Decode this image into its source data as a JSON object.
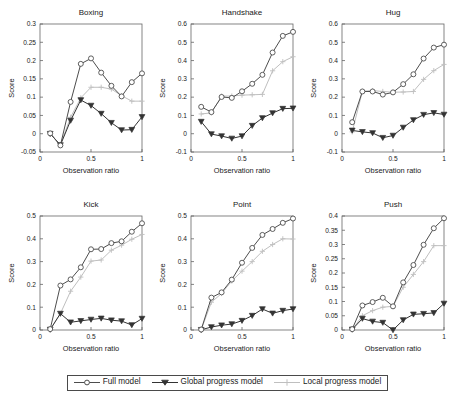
{
  "figure": {
    "axis_label_x": "Observation ratio",
    "axis_label_y": "Score",
    "xticks": [
      "0",
      "0.5",
      "1"
    ],
    "xtick_values": [
      0,
      0.5,
      1
    ]
  },
  "legend": {
    "position": "bottom-center",
    "entries": [
      {
        "label": "Full model",
        "marker": "circle",
        "color": "#4d4d4d"
      },
      {
        "label": "Global progress model",
        "marker": "triangle-down",
        "color": "#333333"
      },
      {
        "label": "Local progress model",
        "marker": "plus",
        "color": "#bfbfbf"
      }
    ]
  },
  "chart_data": [
    {
      "type": "line",
      "title": "Boxing",
      "xlabel": "Observation ratio",
      "ylabel": "Score",
      "xlim": [
        0,
        1
      ],
      "ylim": [
        -0.05,
        0.3
      ],
      "yticks": [
        -0.05,
        0,
        0.05,
        0.1,
        0.15,
        0.2,
        0.25,
        0.3
      ],
      "ytick_labels": [
        "-0.05",
        "0",
        "0.05",
        "0.1",
        "0.15",
        "0.2",
        "0.25",
        "0.3"
      ],
      "grid": false,
      "x": [
        0.1,
        0.2,
        0.3,
        0.4,
        0.5,
        0.6,
        0.7,
        0.8,
        0.9,
        1.0
      ],
      "series": [
        {
          "name": "Full model",
          "marker": "circle",
          "color": "#4d4d4d",
          "values": [
            0.001,
            -0.032,
            0.087,
            0.191,
            0.206,
            0.167,
            0.131,
            0.102,
            0.141,
            0.165
          ]
        },
        {
          "name": "Global progress model",
          "marker": "triangle-down",
          "color": "#333333",
          "values": [
            0.0,
            -0.031,
            0.036,
            0.092,
            0.077,
            0.055,
            0.03,
            0.01,
            0.011,
            0.046,
            0.074
          ]
        },
        {
          "name": "Local progress model",
          "marker": "plus",
          "color": "#bfbfbf",
          "values": [
            0.0,
            -0.03,
            0.045,
            0.098,
            0.127,
            0.127,
            0.122,
            0.104,
            0.089,
            0.089
          ]
        }
      ]
    },
    {
      "type": "line",
      "title": "Handshake",
      "xlabel": "Observation ratio",
      "ylabel": "Score",
      "xlim": [
        0,
        1
      ],
      "ylim": [
        -0.1,
        0.6
      ],
      "yticks": [
        -0.1,
        0,
        0.1,
        0.2,
        0.3,
        0.4,
        0.5,
        0.6
      ],
      "ytick_labels": [
        "-0.1",
        "0",
        "0.1",
        "0.2",
        "0.3",
        "0.4",
        "0.5",
        "0.6"
      ],
      "grid": false,
      "x": [
        0.1,
        0.2,
        0.3,
        0.4,
        0.5,
        0.6,
        0.7,
        0.8,
        0.9,
        1.0
      ],
      "series": [
        {
          "name": "Full model",
          "marker": "circle",
          "color": "#4d4d4d",
          "values": [
            0.147,
            0.118,
            0.201,
            0.196,
            0.232,
            0.273,
            0.322,
            0.444,
            0.535,
            0.557
          ]
        },
        {
          "name": "Global progress model",
          "marker": "triangle-down",
          "color": "#333333",
          "values": [
            0.066,
            -0.002,
            -0.013,
            -0.026,
            -0.013,
            0.044,
            0.086,
            0.113,
            0.137,
            0.139
          ]
        },
        {
          "name": "Local progress model",
          "marker": "plus",
          "color": "#bfbfbf",
          "values": [
            0.108,
            0.114,
            0.206,
            0.206,
            0.211,
            0.213,
            0.215,
            0.344,
            0.394,
            0.421
          ]
        }
      ]
    },
    {
      "type": "line",
      "title": "Hug",
      "xlabel": "Observation ratio",
      "ylabel": "Score",
      "xlim": [
        0,
        1
      ],
      "ylim": [
        -0.1,
        0.6
      ],
      "yticks": [
        -0.1,
        0,
        0.1,
        0.2,
        0.3,
        0.4,
        0.5,
        0.6
      ],
      "ytick_labels": [
        "-0.1",
        "0",
        "0.1",
        "0.2",
        "0.3",
        "0.4",
        "0.5",
        "0.6"
      ],
      "grid": false,
      "x": [
        0.1,
        0.2,
        0.3,
        0.4,
        0.5,
        0.6,
        0.7,
        0.8,
        0.9,
        1.0
      ],
      "series": [
        {
          "name": "Full model",
          "marker": "circle",
          "color": "#4d4d4d",
          "values": [
            0.063,
            0.231,
            0.231,
            0.214,
            0.226,
            0.271,
            0.325,
            0.411,
            0.471,
            0.487
          ]
        },
        {
          "name": "Global progress model",
          "marker": "triangle-down",
          "color": "#333333",
          "values": [
            0.018,
            0.01,
            0.004,
            -0.022,
            -0.01,
            0.034,
            0.075,
            0.104,
            0.114,
            0.105
          ]
        },
        {
          "name": "Local progress model",
          "marker": "plus",
          "color": "#bfbfbf",
          "values": [
            0.01,
            0.232,
            0.236,
            0.231,
            0.227,
            0.228,
            0.231,
            0.297,
            0.345,
            0.379
          ]
        }
      ]
    },
    {
      "type": "line",
      "title": "Kick",
      "xlabel": "Observation ratio",
      "ylabel": "Score",
      "xlim": [
        0,
        1
      ],
      "ylim": [
        0,
        0.5
      ],
      "yticks": [
        0,
        0.1,
        0.2,
        0.3,
        0.4,
        0.5
      ],
      "ytick_labels": [
        "0",
        "0.1",
        "0.2",
        "0.3",
        "0.4",
        "0.5"
      ],
      "grid": false,
      "x": [
        0.1,
        0.2,
        0.3,
        0.4,
        0.5,
        0.6,
        0.7,
        0.8,
        0.9,
        1.0
      ],
      "series": [
        {
          "name": "Full model",
          "marker": "circle",
          "color": "#4d4d4d",
          "values": [
            0.004,
            0.195,
            0.222,
            0.275,
            0.354,
            0.355,
            0.381,
            0.389,
            0.431,
            0.468
          ]
        },
        {
          "name": "Global progress model",
          "marker": "triangle-down",
          "color": "#333333",
          "values": [
            0.002,
            0.072,
            0.034,
            0.04,
            0.046,
            0.051,
            0.043,
            0.039,
            0.022,
            0.05
          ]
        },
        {
          "name": "Local progress model",
          "marker": "plus",
          "color": "#bfbfbf",
          "values": [
            0.002,
            0.072,
            0.17,
            0.232,
            0.302,
            0.307,
            0.35,
            0.372,
            0.398,
            0.419
          ]
        }
      ]
    },
    {
      "type": "line",
      "title": "Point",
      "xlabel": "Observation ratio",
      "ylabel": "Score",
      "xlim": [
        0,
        1
      ],
      "ylim": [
        0,
        0.5
      ],
      "yticks": [
        0,
        0.1,
        0.2,
        0.3,
        0.4,
        0.5
      ],
      "ytick_labels": [
        "0",
        "0.1",
        "0.2",
        "0.3",
        "0.4",
        "0.5"
      ],
      "grid": false,
      "x": [
        0.1,
        0.2,
        0.3,
        0.4,
        0.5,
        0.6,
        0.7,
        0.8,
        0.9,
        1.0
      ],
      "series": [
        {
          "name": "Full model",
          "marker": "circle",
          "color": "#4d4d4d",
          "values": [
            0.002,
            0.142,
            0.165,
            0.221,
            0.295,
            0.36,
            0.417,
            0.443,
            0.47,
            0.489
          ]
        },
        {
          "name": "Global progress model",
          "marker": "triangle-down",
          "color": "#333333",
          "values": [
            0.001,
            0.013,
            0.021,
            0.026,
            0.041,
            0.063,
            0.092,
            0.073,
            0.085,
            0.092
          ]
        },
        {
          "name": "Local progress model",
          "marker": "plus",
          "color": "#bfbfbf",
          "values": [
            0.001,
            0.122,
            0.16,
            0.215,
            0.258,
            0.3,
            0.345,
            0.375,
            0.4,
            0.399
          ]
        }
      ]
    },
    {
      "type": "line",
      "title": "Push",
      "xlabel": "Observation ratio",
      "ylabel": "Score",
      "xlim": [
        0,
        1
      ],
      "ylim": [
        0,
        0.4
      ],
      "yticks": [
        0,
        0.05,
        0.1,
        0.15,
        0.2,
        0.25,
        0.3,
        0.35,
        0.4
      ],
      "ytick_labels": [
        "0",
        "0.05",
        "0.1",
        "0.15",
        "0.2",
        "0.25",
        "0.3",
        "0.35",
        "0.4"
      ],
      "grid": false,
      "x": [
        0.1,
        0.2,
        0.3,
        0.4,
        0.5,
        0.6,
        0.7,
        0.8,
        0.9,
        1.0
      ],
      "series": [
        {
          "name": "Full model",
          "marker": "circle",
          "color": "#4d4d4d",
          "values": [
            0.003,
            0.086,
            0.098,
            0.113,
            0.083,
            0.167,
            0.228,
            0.299,
            0.357,
            0.392
          ]
        },
        {
          "name": "Global progress model",
          "marker": "triangle-down",
          "color": "#333333",
          "values": [
            0.002,
            0.04,
            0.03,
            0.026,
            0.0,
            0.035,
            0.055,
            0.057,
            0.06,
            0.093
          ]
        },
        {
          "name": "Local progress model",
          "marker": "plus",
          "color": "#bfbfbf",
          "values": [
            0.001,
            0.05,
            0.068,
            0.08,
            0.083,
            0.15,
            0.195,
            0.24,
            0.296,
            0.296
          ]
        }
      ]
    }
  ]
}
